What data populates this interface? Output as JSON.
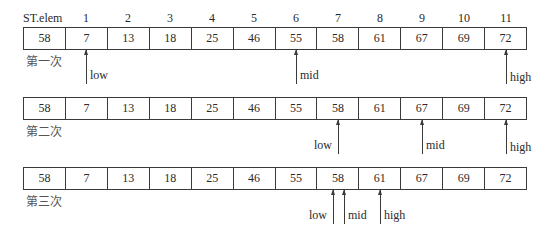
{
  "header": {
    "label": "ST.elem",
    "indices": [
      "1",
      "2",
      "3",
      "4",
      "5",
      "6",
      "7",
      "8",
      "9",
      "10",
      "11"
    ]
  },
  "array": [
    "58",
    "7",
    "13",
    "18",
    "25",
    "46",
    "55",
    "58",
    "61",
    "67",
    "69",
    "72"
  ],
  "passes": [
    {
      "label": "第一次",
      "values": [
        "58",
        "7",
        "13",
        "18",
        "25",
        "46",
        "55",
        "58",
        "61",
        "67",
        "69",
        "72"
      ],
      "pointers": [
        {
          "name": "low",
          "index": 1
        },
        {
          "name": "mid",
          "index": 6
        },
        {
          "name": "high",
          "index": 11
        }
      ]
    },
    {
      "label": "第二次",
      "values": [
        "58",
        "7",
        "13",
        "18",
        "25",
        "46",
        "55",
        "58",
        "61",
        "67",
        "69",
        "72"
      ],
      "pointers": [
        {
          "name": "low",
          "index": 7
        },
        {
          "name": "mid",
          "index": 9
        },
        {
          "name": "high",
          "index": 11
        }
      ]
    },
    {
      "label": "第三次",
      "values": [
        "58",
        "7",
        "13",
        "18",
        "25",
        "46",
        "55",
        "58",
        "61",
        "67",
        "69",
        "72"
      ],
      "pointers": [
        {
          "name": "low",
          "index": 7
        },
        {
          "name": "mid",
          "index": 7
        },
        {
          "name": "high",
          "index": 8
        }
      ]
    }
  ]
}
